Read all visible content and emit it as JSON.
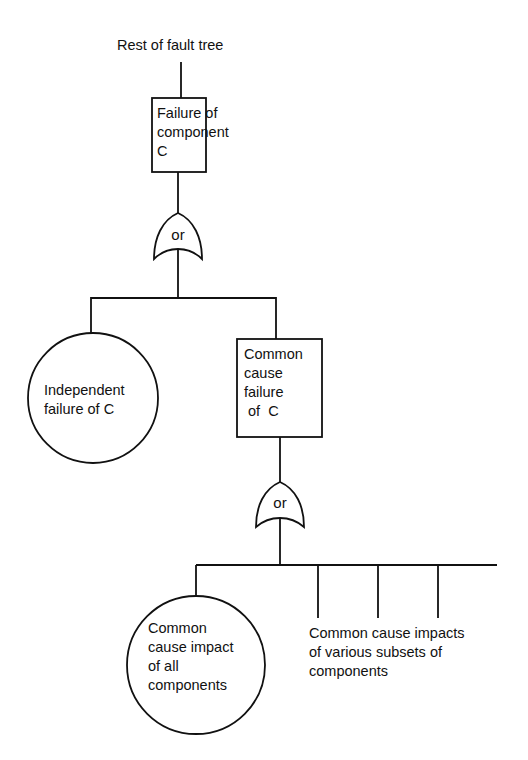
{
  "diagram": {
    "type": "fault-tree",
    "header_fragment": "",
    "top_label": "Rest of fault tree",
    "nodes": [
      {
        "id": "failure-component-c",
        "shape": "rectangle",
        "lines": [
          "Failure of",
          "component",
          "C"
        ]
      },
      {
        "id": "or-gate-1",
        "shape": "or-gate",
        "label": "or"
      },
      {
        "id": "independent-failure-c",
        "shape": "circle",
        "lines": [
          "Independent",
          "failure of C"
        ]
      },
      {
        "id": "common-cause-failure-c",
        "shape": "rectangle",
        "lines": [
          "Common",
          "cause",
          "failure",
          " of  C"
        ]
      },
      {
        "id": "or-gate-2",
        "shape": "or-gate",
        "label": "or"
      },
      {
        "id": "common-cause-impact-all",
        "shape": "circle",
        "lines": [
          "Common",
          "cause impact",
          "of all",
          "components"
        ]
      },
      {
        "id": "subsets-label",
        "shape": "text",
        "lines": [
          "Common cause impacts",
          "of various subsets of",
          "components"
        ]
      }
    ],
    "edges": [
      [
        "top",
        "failure-component-c"
      ],
      [
        "failure-component-c",
        "or-gate-1"
      ],
      [
        "or-gate-1",
        "independent-failure-c"
      ],
      [
        "or-gate-1",
        "common-cause-failure-c"
      ],
      [
        "common-cause-failure-c",
        "or-gate-2"
      ],
      [
        "or-gate-2",
        "common-cause-impact-all"
      ],
      [
        "or-gate-2",
        "subset-branch-1"
      ],
      [
        "or-gate-2",
        "subset-branch-2"
      ],
      [
        "or-gate-2",
        "subset-branch-3"
      ],
      [
        "or-gate-2",
        "subset-branch-continuing"
      ]
    ],
    "colors": {
      "line": "#111111",
      "background": "#ffffff"
    }
  }
}
